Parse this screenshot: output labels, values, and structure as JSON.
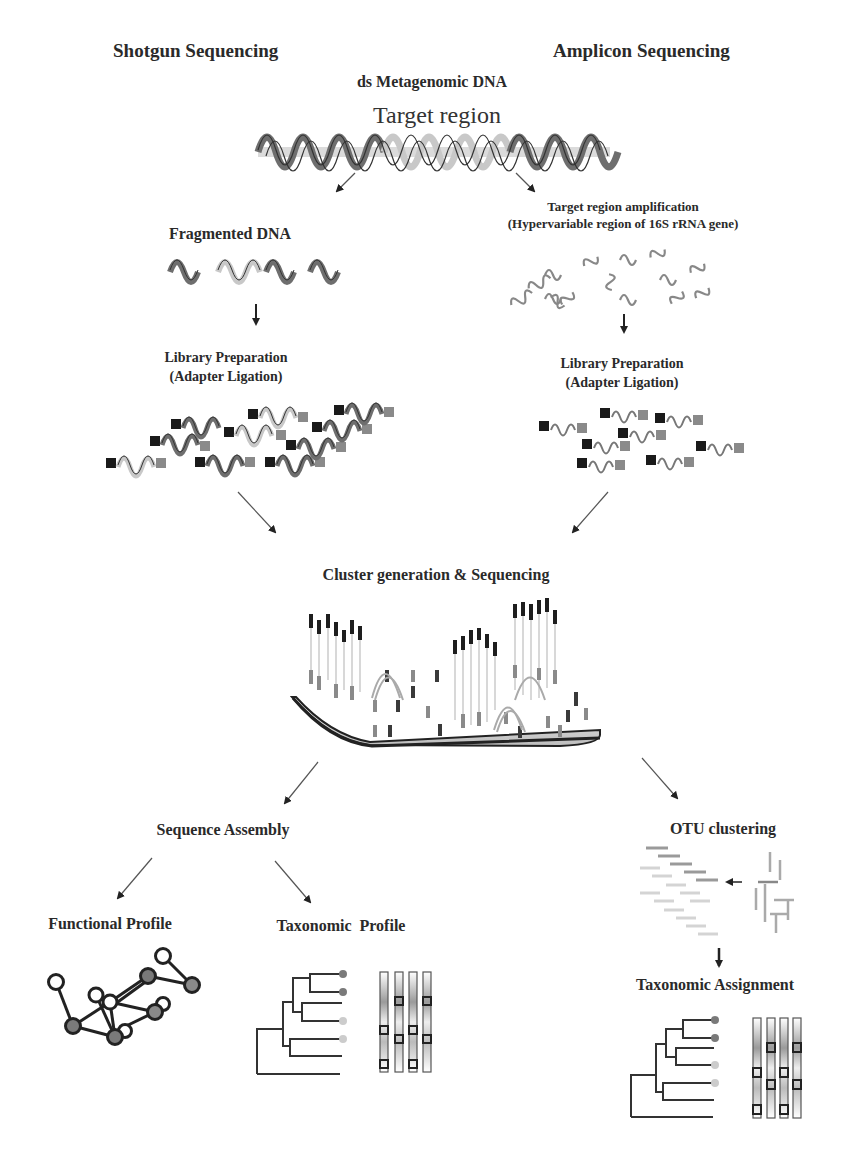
{
  "figure": {
    "headers": {
      "left": "Shotgun Sequencing",
      "right": "Amplicon Sequencing"
    },
    "source": {
      "title": "ds Metagenomic DNA",
      "target_label": "Target region"
    },
    "shotgun": {
      "step1": "Fragmented DNA",
      "step2_line1": "Library Preparation",
      "step2_line2": "(Adapter Ligation)"
    },
    "amplicon": {
      "step1_line1": "Target region amplification",
      "step1_line2": "(Hypervariable region of 16S rRNA gene)",
      "step2_line1": "Library Preparation",
      "step2_line2": "(Adapter Ligation)"
    },
    "merge": {
      "title": "Cluster generation & Sequencing"
    },
    "shotgun_analysis": {
      "assembly": "Sequence Assembly",
      "functional": "Functional Profile",
      "taxonomic": "Taxonomic  Profile"
    },
    "amplicon_analysis": {
      "clustering": "OTU clustering",
      "assignment": "Taxonomic Assignment"
    },
    "colors": {
      "dark_strand": "#6e6e6e",
      "light_strand": "#c8c8c8",
      "outline": "#333333",
      "adapter_dark": "#1a1a1a",
      "adapter_light": "#8a8a8a",
      "node_filled": "#7a7a7a",
      "node_empty": "#ffffff"
    }
  }
}
